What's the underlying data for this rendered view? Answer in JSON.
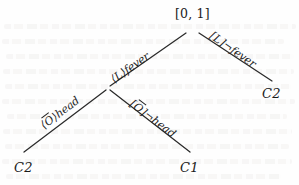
{
  "figure": {
    "kind": "tableau-tree",
    "root": {
      "label": "[0, 1]"
    },
    "nodes": [
      {
        "id": "root",
        "label": "[0, 1]",
        "x": 192,
        "y": 27,
        "kind": "root"
      },
      {
        "id": "branch",
        "label": "",
        "x": 108,
        "y": 88,
        "kind": "internal"
      },
      {
        "id": "leaf-right",
        "label": "C2",
        "x": 265,
        "y": 96,
        "kind": "leaf"
      },
      {
        "id": "leaf-left",
        "label": "C2",
        "x": 17,
        "y": 170,
        "kind": "leaf"
      },
      {
        "id": "leaf-mid",
        "label": "C1",
        "x": 183,
        "y": 170,
        "kind": "leaf"
      }
    ],
    "edges": [
      {
        "id": "edge-fever",
        "from": "root",
        "to": "branch",
        "modality": "⟨L⟩",
        "modality_bracket": "angle",
        "proposition": "fever",
        "negated": false,
        "label_text": "⟨L⟩fever"
      },
      {
        "id": "edge-not-fever",
        "from": "root",
        "to": "leaf-right",
        "modality": "[L]",
        "modality_bracket": "square",
        "proposition": "fever",
        "negated": true,
        "label_text": "[L]¬fever"
      },
      {
        "id": "edge-head",
        "from": "branch",
        "to": "leaf-left",
        "modality": "⟨O̅⟩",
        "modality_bracket": "angle",
        "proposition": "head",
        "negated": false,
        "label_text": "⟨O̅⟩head"
      },
      {
        "id": "edge-not-head",
        "from": "branch",
        "to": "leaf-mid",
        "modality": "[O̅]",
        "modality_bracket": "square",
        "proposition": "head",
        "negated": true,
        "label_text": "[O̅]¬head"
      }
    ],
    "labels": {
      "fever_mod_open": "⟨",
      "fever_mod_name": "L",
      "fever_mod_close": "⟩",
      "fever_prop": "fever",
      "not_fever_mod_open": "[",
      "not_fever_mod_name": "L",
      "not_fever_mod_close": "]",
      "not_fever_neg": "¬",
      "not_fever_prop": "fever",
      "head_mod_open": "⟨",
      "head_mod_name": "O",
      "head_mod_close": "⟩",
      "head_prop": "head",
      "not_head_mod_open": "[",
      "not_head_mod_name": "O",
      "not_head_mod_close": "]",
      "not_head_neg": "¬",
      "not_head_prop": "head"
    },
    "colors": {
      "ink": "#1b1b1b",
      "line": "#2a2a2a",
      "background": "#fefefe",
      "bleed": "#e9e7e4"
    }
  }
}
